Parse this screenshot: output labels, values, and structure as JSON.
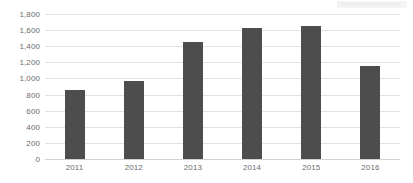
{
  "chart_data": {
    "type": "bar",
    "title": "",
    "subtitle": "",
    "xlabel": "",
    "ylabel": "",
    "categories": [
      "2011",
      "2012",
      "2013",
      "2014",
      "2015",
      "2016"
    ],
    "values": [
      855,
      965,
      1450,
      1625,
      1650,
      1160
    ],
    "series": [
      {
        "name": "",
        "values": [
          855,
          965,
          1450,
          1625,
          1650,
          1160
        ]
      }
    ],
    "ylim": [
      0,
      1800
    ],
    "ytick_step": 200,
    "ytick_labels": [
      "0",
      "200",
      "400",
      "600",
      "800",
      "1,000",
      "1,200",
      "1,400",
      "1,600",
      "1,800"
    ],
    "ytick_values": [
      0,
      200,
      400,
      600,
      800,
      1000,
      1200,
      1400,
      1600,
      1800
    ],
    "grid": true,
    "grid_axis": "y",
    "legend": false,
    "legend_position": "none",
    "annotations": [],
    "colors": {
      "bar": "#4d4d4d",
      "gridline": "#e2e2e2",
      "baseline": "#d2d2d2",
      "tick_label": "#6b6b6b",
      "background": "#ffffff"
    }
  }
}
